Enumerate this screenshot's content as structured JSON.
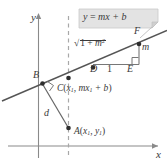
{
  "figure": {
    "axes": {
      "x_label": "x",
      "y_label": "y"
    },
    "callout": {
      "equation_y": "y",
      "equation_eq": " = ",
      "equation_m": "m",
      "equation_x": "x",
      "equation_plus_b": " + b",
      "full_text": "y = mx + b",
      "fill_color": "#e3e3e3",
      "border_color": "#b8b8b8"
    },
    "points": {
      "A": {
        "name": "A",
        "coords_open": "(",
        "var_x": "x",
        "sub_x": "1",
        "comma": ", ",
        "var_y": "y",
        "sub_y": "1",
        "coords_close": ")",
        "full_text": "A(x1, y1)"
      },
      "B": {
        "name": "B"
      },
      "C": {
        "name": "C",
        "coords_open": "(",
        "var_x": "x",
        "sub_x": "1",
        "comma": ", ",
        "var_m": "m",
        "var_x2": "x",
        "sub_x2": "1",
        "plus_b": " + b",
        "coords_close": ")",
        "full_text": "C(x1, mx1 + b)"
      },
      "D": {
        "name": "D"
      },
      "E": {
        "name": "E"
      },
      "F": {
        "name": "F"
      }
    },
    "segment_labels": {
      "distance": "d",
      "run": "1",
      "rise": "m",
      "hypotenuse_radical": "√",
      "hypotenuse_one": "1 + ",
      "hypotenuse_m": "m",
      "hypotenuse_exp": "2",
      "hypotenuse_full": "√(1 + m²)"
    },
    "colors": {
      "line": "#555555",
      "axis": "#8a8a8a",
      "dashed": "#a8a8a8",
      "text": "#3a3a3a",
      "point": "#2e2e2e"
    }
  }
}
